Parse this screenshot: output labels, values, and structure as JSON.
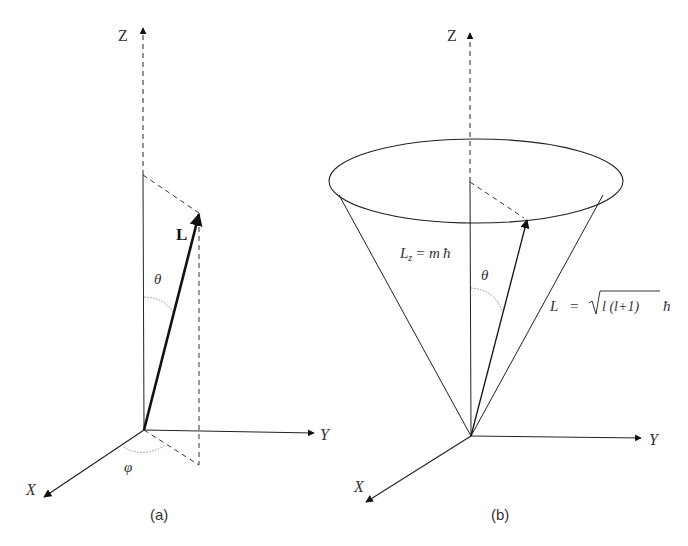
{
  "panel_a": {
    "caption": "(a)",
    "axis_z": "Z",
    "axis_y": "Y",
    "axis_x": "X",
    "vector_label": "L",
    "polar_angle": "θ",
    "azimuth_angle": "φ"
  },
  "panel_b": {
    "caption": "(b)",
    "axis_z": "Z",
    "axis_y": "Y",
    "axis_x": "X",
    "polar_angle": "θ",
    "lz_label_main": "L",
    "lz_label_sub": "z",
    "lz_label_eq": "= m",
    "hbar": "ħ",
    "l_label_main": "L",
    "l_label_eq": "=",
    "l_label_root": "l (l+1)",
    "l_label_hbar": "ħ"
  }
}
